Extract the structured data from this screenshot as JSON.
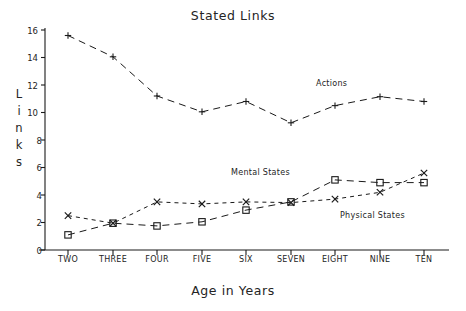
{
  "chart_data": {
    "type": "line",
    "title": "Stated Links",
    "xlabel": "Age in Years",
    "ylabel": "Links",
    "ylabel_letters": [
      "L",
      "i",
      "n",
      "k",
      "s"
    ],
    "categories": [
      "TWO",
      "THREE",
      "FOUR",
      "FIVE",
      "SIX",
      "SEVEN",
      "EIGHT",
      "NINE",
      "TEN"
    ],
    "ylim": [
      0,
      16
    ],
    "yticks": [
      0,
      2,
      4,
      6,
      8,
      10,
      12,
      14,
      16
    ],
    "ytick_labels": [
      "0",
      "2",
      "4",
      "6",
      "8",
      "10",
      "12",
      "14",
      "16"
    ],
    "grid": false,
    "legend": "inline-annotations",
    "series": [
      {
        "name": "Actions",
        "marker": "plus",
        "dash": "long-dash",
        "values": [
          15.6,
          14.05,
          11.2,
          10.05,
          10.8,
          9.25,
          10.5,
          11.15,
          10.8
        ]
      },
      {
        "name": "Mental States",
        "marker": "square",
        "dash": "long-dash",
        "values": [
          1.1,
          1.95,
          1.75,
          2.05,
          2.9,
          3.5,
          5.1,
          4.9,
          4.9
        ]
      },
      {
        "name": "Physical States",
        "marker": "cross",
        "dash": "short-dash",
        "values": [
          2.5,
          1.95,
          3.5,
          3.35,
          3.5,
          3.45,
          3.7,
          4.2,
          5.6
        ]
      }
    ],
    "annotations": [
      {
        "text": "Actions",
        "x_px": 316,
        "y_px": 79
      },
      {
        "text": "Mental States",
        "x_px": 231,
        "y_px": 168
      },
      {
        "text": "Physical States",
        "x_px": 340,
        "y_px": 211
      }
    ],
    "colors": {
      "line": "#1a1a1a",
      "axis": "#1a1a1a",
      "text": "#242424",
      "background": "#ffffff"
    }
  },
  "layout": {
    "plot_left_px": 45,
    "plot_right_px": 449,
    "plot_top_px": 30,
    "plot_bottom_px": 250,
    "x_positions_px": [
      68,
      113,
      157,
      202,
      246,
      291,
      335,
      380,
      424
    ],
    "y_zero_px": 250,
    "y_per_unit_px": 13.75
  }
}
